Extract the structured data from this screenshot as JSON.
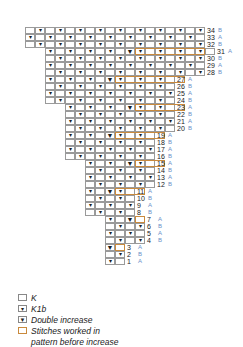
{
  "chart_title": "",
  "grid": {
    "origin_x": 25,
    "origin_y": 27,
    "cell_w": 10,
    "row_h": 7,
    "total_rows": 34
  },
  "symbols": {
    "K": "",
    "K1b": "▾",
    "Double increase": "▼"
  },
  "rows": [
    {
      "n": 34,
      "start": 0,
      "cells": ".v.v.v.v.v.v.v.v.v",
      "side": "B",
      "box": null
    },
    {
      "n": 33,
      "start": 0,
      "cells": "v.v.v.v.v.v.v.v.v.",
      "side": "A",
      "box": null
    },
    {
      "n": 32,
      "start": 0,
      "cells": ".v.v.v.v.v.v.v.v.v",
      "side": "B",
      "box": null
    },
    {
      "n": 31,
      "start": 2,
      "cells": "v.v.v.v.Dv.v.v.v.",
      "side": "A",
      "box": [
        11,
        18
      ]
    },
    {
      "n": 30,
      "start": 2,
      "cells": ".v.v.v.v.v.v.v.v",
      "side": "B",
      "box": null
    },
    {
      "n": 29,
      "start": 2,
      "cells": "v.v.v.v.v.v.v.v.",
      "side": "A",
      "box": null
    },
    {
      "n": 28,
      "start": 2,
      "cells": ".v.v.v.v.v.v.v.v",
      "side": "B",
      "box": null
    },
    {
      "n": 27,
      "start": 2,
      "cells": "v.v.v.Dv.v.v.",
      "side": "A",
      "box": [
        9,
        16
      ]
    },
    {
      "n": 26,
      "start": 2,
      "cells": ".v.v.v.v.v.v.",
      "side": "B",
      "box": null
    },
    {
      "n": 25,
      "start": 2,
      "cells": "v.v.v.v.v.v.v",
      "side": "A",
      "box": null
    },
    {
      "n": 24,
      "start": 2,
      "cells": ".v.v.v.v.v.v.",
      "side": "B",
      "box": null
    },
    {
      "n": 23,
      "start": 4,
      "cells": "v.v.v.Dv.v.",
      "side": "A",
      "box": [
        11,
        16
      ]
    },
    {
      "n": 22,
      "start": 4,
      "cells": ".v.v.v.v.v.",
      "side": "B",
      "box": null
    },
    {
      "n": 21,
      "start": 4,
      "cells": "v.v.v.v.v.v",
      "side": "A",
      "box": null
    },
    {
      "n": 20,
      "start": 4,
      "cells": ".v.v.v.v.v.",
      "side": "B",
      "box": null
    },
    {
      "n": 19,
      "start": 4,
      "cells": "v.v.Dv.v.",
      "side": "A",
      "box": [
        9,
        14
      ]
    },
    {
      "n": 18,
      "start": 4,
      "cells": ".v.v.v.v.",
      "side": "B",
      "box": null
    },
    {
      "n": 17,
      "start": 4,
      "cells": "v.v.v.v.v",
      "side": "A",
      "box": null
    },
    {
      "n": 16,
      "start": 4,
      "cells": ".v.v.v.v.",
      "side": "B",
      "box": null
    },
    {
      "n": 15,
      "start": 6,
      "cells": "v.v.Dv.",
      "side": "A",
      "box": [
        11,
        14
      ]
    },
    {
      "n": 14,
      "start": 6,
      "cells": ".v.v.v.",
      "side": "B",
      "box": null
    },
    {
      "n": 13,
      "start": 6,
      "cells": "v.v.v.v",
      "side": "A",
      "box": null
    },
    {
      "n": 12,
      "start": 6,
      "cells": ".v.v.v.",
      "side": "B",
      "box": null
    },
    {
      "n": 11,
      "start": 6,
      "cells": "v.Dv.",
      "side": "A",
      "box": [
        9,
        12
      ]
    },
    {
      "n": 10,
      "start": 6,
      "cells": ".v.v.",
      "side": "B",
      "box": null
    },
    {
      "n": 9,
      "start": 6,
      "cells": "v.v.v",
      "side": "A",
      "box": null
    },
    {
      "n": 8,
      "start": 6,
      "cells": ".v.v.",
      "side": "B",
      "box": null
    },
    {
      "n": 7,
      "start": 8,
      "cells": "v.D.",
      "side": "A",
      "box": [
        11,
        12
      ]
    },
    {
      "n": 6,
      "start": 8,
      "cells": ".v.v",
      "side": "B",
      "box": null
    },
    {
      "n": 5,
      "start": 8,
      "cells": "v.v.",
      "side": "A",
      "box": null
    },
    {
      "n": 4,
      "start": 8,
      "cells": ".v.v",
      "side": "B",
      "box": null
    },
    {
      "n": 3,
      "start": 8,
      "cells": "D.",
      "side": "A",
      "box": [
        9,
        10
      ]
    },
    {
      "n": 2,
      "start": 8,
      "cells": ".v",
      "side": "B",
      "box": null
    },
    {
      "n": 1,
      "start": 8,
      "cells": "v.",
      "side": "A",
      "box": null
    }
  ],
  "legend": [
    {
      "icon": "knit-icon",
      "symbol": "",
      "label": "K",
      "style": "plain"
    },
    {
      "icon": "k1b-icon",
      "symbol": "▾",
      "label": "K1b",
      "style": "plain"
    },
    {
      "icon": "double-increase-icon",
      "symbol": "▼",
      "label": "Double increase",
      "style": "plain"
    },
    {
      "icon": "stitches-worked-box-icon",
      "symbol": "",
      "label": "Stitches worked in",
      "label2": "pattern before increase",
      "style": "orange"
    }
  ],
  "colors": {
    "grid_line": "#9a9a9a",
    "box_outline": "#c98a3d",
    "side_label": "#6a8fc9",
    "text": "#1a1a1a"
  }
}
